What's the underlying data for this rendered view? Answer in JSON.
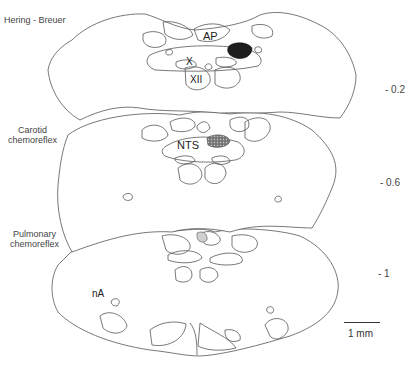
{
  "sections": [
    {
      "label": "Hering - Breuer",
      "level": "- 0.2",
      "structures": [
        "AP",
        "X",
        "XII"
      ],
      "marker": {
        "fill": "#222222",
        "style": "solid"
      }
    },
    {
      "label_line1": "Carotid",
      "label_line2": "chemoreflex",
      "level": "- 0.6",
      "structures": [
        "NTS"
      ],
      "marker": {
        "fill": "#555555",
        "style": "hatched"
      }
    },
    {
      "label_line1": "Pulmonary",
      "label_line2": "chemoreflex",
      "level": "- 1",
      "structures": [
        "nA"
      ],
      "marker": {
        "fill": "#cccccc",
        "style": "light"
      }
    }
  ],
  "scale_bar": {
    "label": "1 mm"
  }
}
